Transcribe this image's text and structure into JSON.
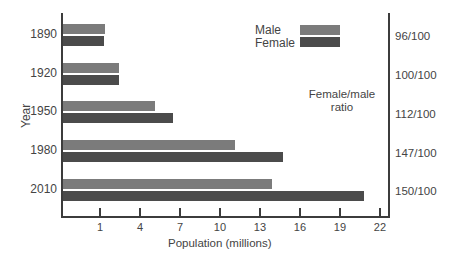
{
  "chart_data": {
    "type": "bar",
    "orientation": "horizontal",
    "title": "",
    "xlabel": "Population (millions)",
    "ylabel": "Year",
    "categories": [
      "1890",
      "1920",
      "1950",
      "1980",
      "2010"
    ],
    "series": [
      {
        "name": "Male",
        "color": "#7b7b7b",
        "values": [
          1.4,
          2.4,
          5.1,
          11.1,
          13.9
        ]
      },
      {
        "name": "Female",
        "color": "#4b4b4b",
        "values": [
          1.3,
          2.4,
          6.5,
          14.7,
          20.8
        ]
      }
    ],
    "x_ticks": [
      "1",
      "4",
      "7",
      "10",
      "13",
      "16",
      "19",
      "22"
    ],
    "secondary_axis": {
      "title": "Female/male ratio",
      "labels": [
        "96/100",
        "100/100",
        "112/100",
        "147/100",
        "150/100"
      ]
    },
    "legend": [
      "Male",
      "Female"
    ],
    "legend_position": "top-right",
    "grid": false
  },
  "labels": {
    "ylabel": "Year",
    "xlabel": "Population (millions)",
    "ratio_title_line1": "Female/male",
    "ratio_title_line2": "ratio",
    "legend_male": "Male",
    "legend_female": "Female",
    "years": [
      "1890",
      "1920",
      "1950",
      "1980",
      "2010"
    ],
    "ratios": [
      "96/100",
      "100/100",
      "112/100",
      "147/100",
      "150/100"
    ],
    "ticks": [
      "1",
      "4",
      "7",
      "10",
      "13",
      "16",
      "19",
      "22"
    ]
  },
  "colors": {
    "male": "#7b7b7b",
    "female": "#4b4b4b",
    "axis": "#3c3c3c"
  }
}
